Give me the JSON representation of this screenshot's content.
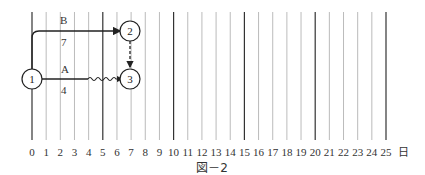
{
  "diagram": {
    "type": "arrow-network-timescale",
    "caption": "図－2",
    "axis": {
      "ticks": [
        "0",
        "1",
        "2",
        "3",
        "4",
        "5",
        "6",
        "7",
        "8",
        "9",
        "10",
        "11",
        "12",
        "13",
        "14",
        "15",
        "16",
        "17",
        "18",
        "19",
        "20",
        "21",
        "22",
        "23",
        "24",
        "25"
      ],
      "unit": "日",
      "major_every": 5
    },
    "nodes": [
      {
        "id": "1",
        "label": "1"
      },
      {
        "id": "2",
        "label": "2"
      },
      {
        "id": "3",
        "label": "3"
      }
    ],
    "activities": [
      {
        "name": "B",
        "duration": "7",
        "from": "1",
        "to": "2"
      },
      {
        "name": "A",
        "duration": "4",
        "from": "1",
        "to": "3",
        "float": "wavy"
      },
      {
        "name": "dummy",
        "from": "2",
        "to": "3",
        "style": "dashed"
      }
    ]
  }
}
